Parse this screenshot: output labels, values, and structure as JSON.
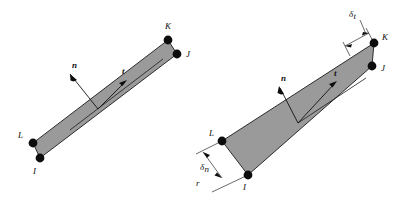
{
  "figure": {
    "background_color": "#ffffff",
    "panel_fill_color": "#9a9a9a",
    "panel_stroke_color": "#1b1b1b",
    "node_color": "#0d0d0d",
    "label_color": "#101010"
  },
  "diagrams": [
    {
      "id": "left-diagram",
      "name": "uniform-thickness-element",
      "description": "Narrow quadrilateral strip of uniform thickness with nodes I, J, K, L and local normal n and tangent t vectors",
      "nodes": [
        {
          "label": "I",
          "position": "bottom-left-outer"
        },
        {
          "label": "J",
          "position": "top-right-outer"
        },
        {
          "label": "K",
          "position": "top-right-inner"
        },
        {
          "label": "L",
          "position": "bottom-left-inner"
        }
      ],
      "vectors": [
        {
          "label": "n",
          "kind": "normal",
          "direction": "up-left"
        },
        {
          "label": "t",
          "kind": "tangent",
          "direction": "up-right"
        }
      ]
    },
    {
      "id": "right-diagram",
      "name": "tapered-thickness-element",
      "description": "Tapered quadrilateral wedge with nodes I, J, K, L, local normal n and tangent t, plus thickness dimensions at each end",
      "nodes": [
        {
          "label": "I",
          "position": "bottom-left-outer"
        },
        {
          "label": "J",
          "position": "top-right-outer"
        },
        {
          "label": "K",
          "position": "top-right-inner"
        },
        {
          "label": "L",
          "position": "bottom-left-inner"
        }
      ],
      "vectors": [
        {
          "label": "n",
          "kind": "normal",
          "direction": "up-left"
        },
        {
          "label": "t",
          "kind": "tangent",
          "direction": "up-right"
        }
      ],
      "dimensions": [
        {
          "symbol": "δ",
          "subscript": "t",
          "location": "top-right-end",
          "meaning": "thickness at node K end"
        },
        {
          "symbol": "δ",
          "subscript": "n",
          "location": "bottom-left-end",
          "meaning": "thickness at node I end"
        }
      ],
      "extra_labels": [
        {
          "label": "r",
          "location": "bottom-left-below-dimension"
        }
      ]
    }
  ]
}
